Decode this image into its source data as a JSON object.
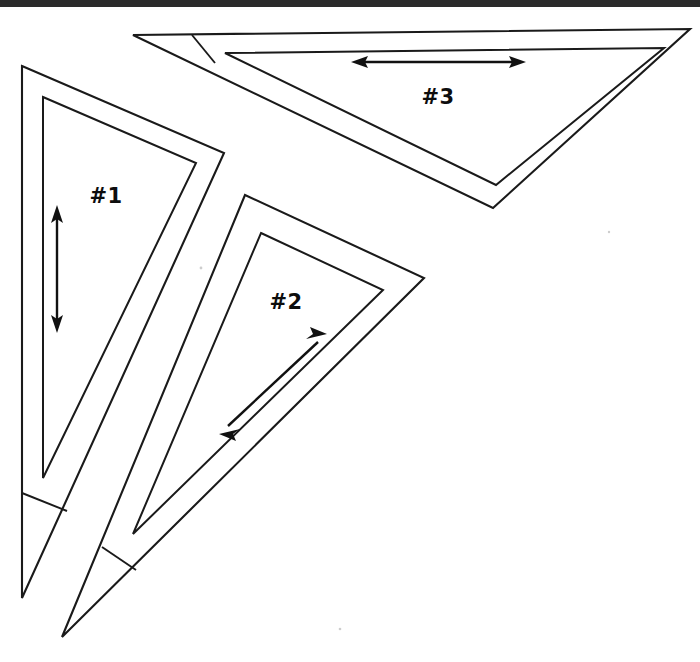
{
  "figure": {
    "background_color": "#ffffff",
    "stroke_color": "#1a1a1a",
    "label_color": "#0d0d0d",
    "width": 700,
    "height": 662
  },
  "scan_edge": {
    "name": "scan-edge-bar",
    "color": "#2b2b2b",
    "x": 0,
    "y": 0,
    "width": 700,
    "height": 7
  },
  "labels": {
    "t1": "#1",
    "t2": "#2",
    "t3": "#3"
  },
  "label_positions": {
    "t1": {
      "x": 106,
      "y": 197
    },
    "t2": {
      "x": 286,
      "y": 303
    },
    "t3": {
      "x": 438,
      "y": 98
    }
  },
  "triangles": [
    {
      "id": "triangle-1",
      "label": "#1",
      "outer_points": "22,66 224,153 22,598",
      "inner_points": "43,97 196,163 43,478",
      "tip_cross_line": {
        "x1": 22,
        "y1": 493,
        "x2": 67,
        "y2": 511
      },
      "arrow": {
        "name": "dimension-arrow-1",
        "orientation": "vertical",
        "x1": 57,
        "y1": 208,
        "x2": 57,
        "y2": 330
      }
    },
    {
      "id": "triangle-2",
      "label": "#2",
      "outer_points": "245,195 424,278 62,637",
      "inner_points": "261,233 383,290 133,534",
      "tip_cross_line": {
        "x1": 102,
        "y1": 547,
        "x2": 136,
        "y2": 570
      },
      "arrow": {
        "name": "dimension-arrow-2",
        "orientation": "diagonal",
        "x1": 222,
        "y1": 432,
        "x2": 324,
        "y2": 336
      }
    },
    {
      "id": "triangle-3",
      "label": "#3",
      "outer_points": "133,35 690,29 493,208",
      "inner_points": "225,53 664,48 496,185",
      "tip_cross_line": {
        "x1": 192,
        "y1": 35,
        "x2": 215,
        "y2": 63
      },
      "arrow": {
        "name": "dimension-arrow-3",
        "orientation": "horizontal",
        "x1": 353,
        "y1": 62,
        "x2": 524,
        "y2": 62
      }
    }
  ],
  "specks": [
    {
      "x": 201,
      "y": 268,
      "r": 1.4
    },
    {
      "x": 340,
      "y": 629,
      "r": 1.3
    },
    {
      "x": 609,
      "y": 232,
      "r": 1.2
    }
  ]
}
